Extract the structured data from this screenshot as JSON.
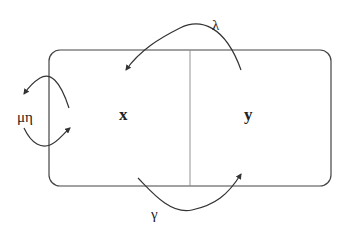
{
  "diagram": {
    "compartments": [
      {
        "id": "x",
        "label": "x"
      },
      {
        "id": "y",
        "label": "y"
      }
    ],
    "arrows": [
      {
        "id": "lambda",
        "label": "λ",
        "from": "y",
        "to": "x",
        "description": "arc over top"
      },
      {
        "id": "gamma",
        "label": "γ",
        "from": "x",
        "to": "y",
        "description": "arc under bottom"
      },
      {
        "id": "mu-eta",
        "label": "μη",
        "from": "x",
        "to": "outside-and-back",
        "description": "loop on left boundary"
      }
    ],
    "colors": {
      "stroke": "#333333",
      "divider": "#777777",
      "background": "#ffffff"
    }
  }
}
